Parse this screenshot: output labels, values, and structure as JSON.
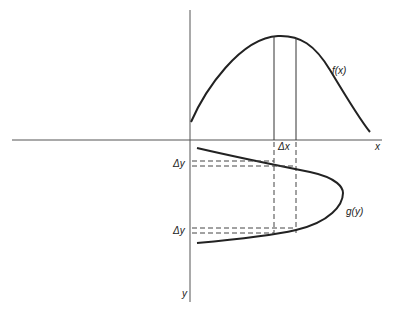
{
  "diagram": {
    "labels": {
      "f_curve": "f(x)",
      "g_curve": "g(y)",
      "x_axis": "x",
      "y_axis": "y",
      "delta_x": "Δx",
      "delta_y_upper": "Δy",
      "delta_y_lower": "Δy"
    },
    "colors": {
      "background": "#ffffff",
      "ink": "#222222",
      "axis": "#555555"
    }
  }
}
